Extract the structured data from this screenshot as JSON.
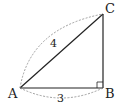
{
  "diagram": {
    "type": "right-triangle",
    "vertices": [
      {
        "name": "A",
        "label": "A"
      },
      {
        "name": "B",
        "label": "B"
      },
      {
        "name": "C",
        "label": "C"
      }
    ],
    "right_angle_at": "B",
    "lengths": [
      {
        "segment": "AB",
        "label": "3"
      },
      {
        "segment": "AC",
        "label": "4"
      }
    ],
    "colors": {
      "line": "#222222",
      "dashed_arc": "#888888",
      "background": "#ffffff"
    }
  }
}
